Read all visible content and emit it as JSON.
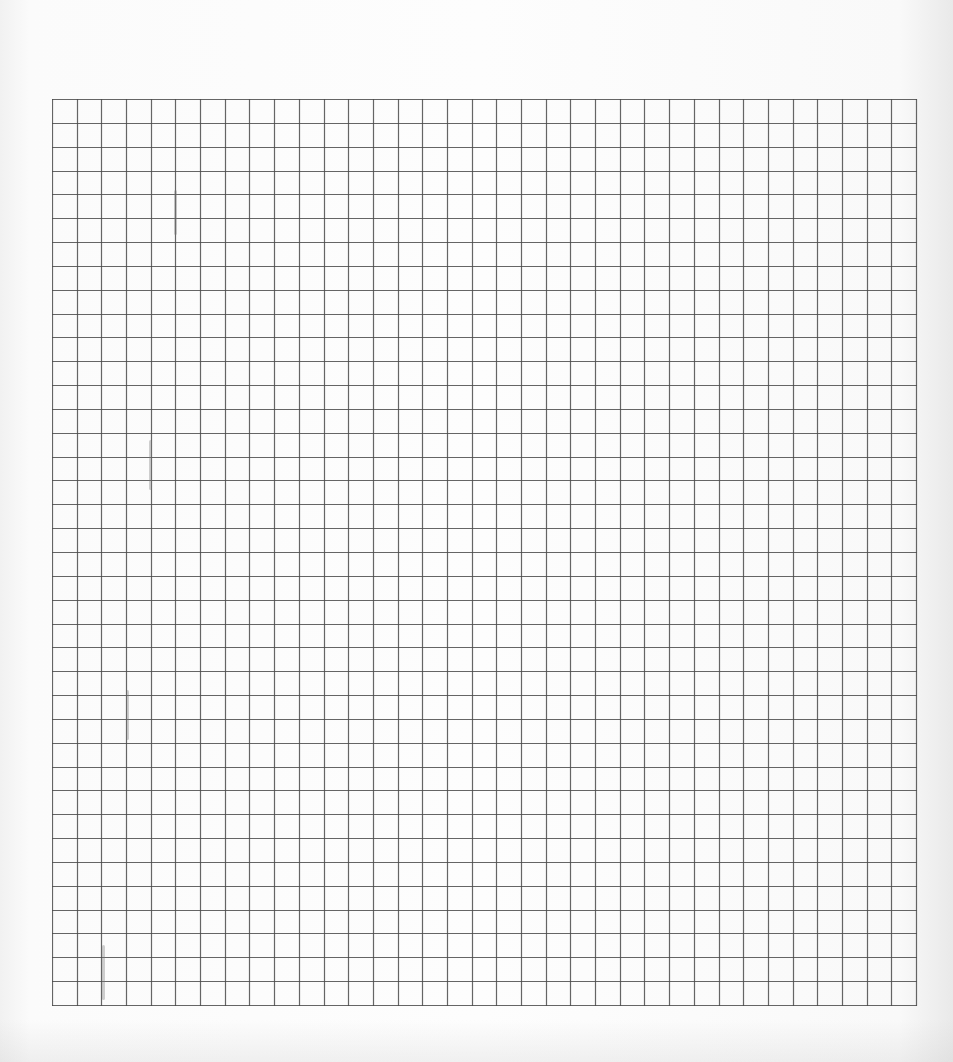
{
  "sheet": {
    "type": "grid-paper",
    "background_color": "#fbfbfb",
    "line_color": "#4a4a4a",
    "grid": {
      "left": 52,
      "top": 99,
      "width": 864,
      "height": 906,
      "columns": 35,
      "rows": 38
    },
    "smudges": [
      {
        "x": 175,
        "y": 190,
        "h": 45
      },
      {
        "x": 150,
        "y": 440,
        "h": 50
      },
      {
        "x": 127,
        "y": 690,
        "h": 50
      },
      {
        "x": 103,
        "y": 945,
        "h": 55
      }
    ]
  }
}
